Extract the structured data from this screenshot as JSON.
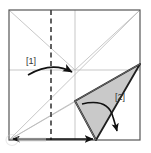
{
  "figure": {
    "type": "origami-fold-diagram",
    "title": "",
    "background_color": "#ffffff",
    "canvas": {
      "width": 151,
      "height": 153
    }
  },
  "colors": {
    "paper_outline": "#555555",
    "crease_line": "#b9b9b9",
    "fold_line_dashed": "#3a3a3a",
    "flap_fill": "#c9c9c9",
    "flap_outline": "#1f1f1f",
    "arrow": "#111111",
    "label_text": "#333333",
    "watermark": "#d8d8d8"
  },
  "paper": {
    "name": "square-sheet",
    "corners": {
      "top_left": [
        9,
        10
      ],
      "top_right": [
        140,
        10
      ],
      "bottom_right": [
        140,
        140
      ],
      "bottom_left": [
        9,
        140
      ]
    }
  },
  "creases": [
    {
      "name": "diagonal-top-left-to-center",
      "from": [
        9,
        10
      ],
      "to": [
        75,
        70
      ]
    },
    {
      "name": "diagonal-top-right-to-center",
      "from": [
        140,
        10
      ],
      "to": [
        75,
        70
      ]
    },
    {
      "name": "diagonal-bottom-left-to-top-right",
      "from": [
        9,
        140
      ],
      "to": [
        140,
        10
      ]
    },
    {
      "name": "horizontal-midline",
      "from": [
        9,
        70
      ],
      "to": [
        140,
        70
      ]
    },
    {
      "name": "vertical-center-line",
      "from": [
        75,
        10
      ],
      "to": [
        75,
        140
      ]
    },
    {
      "name": "ray-bottom-left-to-flap-tip",
      "from": [
        9,
        140
      ],
      "to": [
        75,
        101
      ]
    },
    {
      "name": "ray-bottom-left-to-flap-apex",
      "from": [
        9,
        140
      ],
      "to": [
        140,
        64
      ]
    }
  ],
  "fold_line": {
    "name": "vertical-dashed-fold",
    "from": [
      51,
      10
    ],
    "to": [
      51,
      140
    ],
    "style": "dashed"
  },
  "flap": {
    "name": "shaded-triangle-flap",
    "vertices": [
      [
        75,
        101
      ],
      [
        140,
        64
      ],
      [
        96,
        140
      ]
    ],
    "inner_crease": {
      "from": [
        75,
        101
      ],
      "to": [
        96,
        140
      ]
    }
  },
  "arrows": [
    {
      "name": "fold-arrow-1",
      "label": "[1]",
      "label_position": [
        31,
        64
      ],
      "direction": "right-to-center",
      "path": "M 28,74 Q 52,62 74,72",
      "head_at": [
        74,
        72
      ]
    },
    {
      "name": "fold-arrow-2",
      "label": "[2]",
      "label_position": [
        120,
        100
      ],
      "direction": "wrap-down-right",
      "path": "M 82,104 Q 106,99 113,118 Q 117,128 118,133",
      "head_at": [
        118,
        134
      ]
    },
    {
      "name": "bottom-edge-double-arrow",
      "label": "",
      "direction": "bidirectional-horizontal",
      "path": "M 12,139 L 96,139",
      "head_at": [
        96,
        139
      ]
    }
  ],
  "labels": [
    {
      "name": "step-label-1",
      "text": "[1]",
      "x": 31,
      "y": 64
    },
    {
      "name": "step-label-2",
      "text": "[2]",
      "x": 120,
      "y": 100
    }
  ],
  "watermark": {
    "name": "corner-watermark",
    "x": 6,
    "y": 133,
    "width": 42,
    "height": 13
  }
}
